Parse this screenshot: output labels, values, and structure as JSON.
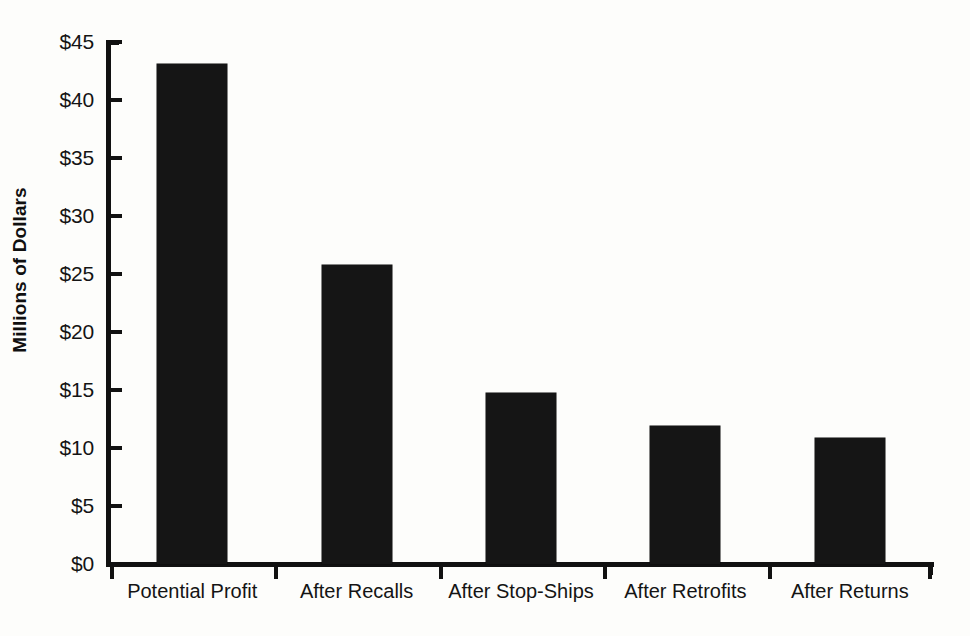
{
  "chart_data": {
    "type": "bar",
    "title": "",
    "subtitle": "",
    "xlabel": "",
    "ylabel": "Millions of Dollars",
    "categories": [
      "Potential Profit",
      "After Recalls",
      "After Stop-Ships",
      "After Retrofits",
      "After Returns"
    ],
    "values": [
      43.1,
      25.8,
      14.7,
      11.9,
      10.9
    ],
    "series": [
      {
        "name": "Profit",
        "values": [
          43.1,
          25.8,
          14.7,
          11.9,
          10.9
        ]
      }
    ],
    "ylim": [
      0,
      45
    ],
    "ytick_values": [
      0,
      5,
      10,
      15,
      20,
      25,
      30,
      35,
      40,
      45
    ],
    "ytick_labels": [
      "$0",
      "$5",
      "$10",
      "$15",
      "$20",
      "$25",
      "$30",
      "$35",
      "$40",
      "$45"
    ],
    "grid": false,
    "legend": false,
    "legend_position": "none",
    "bar_color": "#151515",
    "background_color": "#fdfdfb",
    "axis_color": "#111111"
  }
}
